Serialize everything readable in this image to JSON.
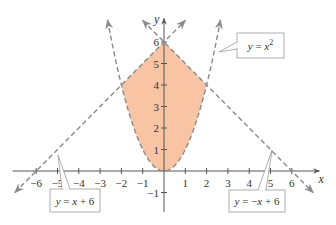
{
  "figure": {
    "type": "region-between-curves",
    "fill_color": "#F9C4A3",
    "curve_color": "#8a8a8a",
    "axis_color": "#555555",
    "x_axis": {
      "label": "x",
      "range": [
        -7,
        7
      ],
      "ticks": [
        -6,
        -5,
        -4,
        -3,
        -2,
        -1,
        1,
        2,
        3,
        4,
        5,
        6
      ],
      "tick_labels": [
        "−6",
        "−5",
        "−4",
        "−3",
        "−2",
        "−1",
        "1",
        "2",
        "3",
        "4",
        "5",
        "6"
      ]
    },
    "y_axis": {
      "label": "y",
      "range": [
        -1.5,
        7
      ],
      "ticks": [
        -1,
        1,
        2,
        3,
        4,
        5,
        6
      ],
      "tick_labels": [
        "−1",
        "1",
        "2",
        "3",
        "4",
        "5",
        "6"
      ]
    },
    "curves": [
      {
        "id": "parabola",
        "equation": "y = x^2",
        "label_parts": [
          "y",
          " = ",
          "x",
          "2"
        ],
        "domain": [
          -2.65,
          2.65
        ],
        "style": "dashed"
      },
      {
        "id": "line-left",
        "equation": "y = x + 6",
        "label_parts": [
          "y",
          " = ",
          "x",
          " + 6"
        ],
        "domain": [
          -7,
          1
        ],
        "style": "dashed"
      },
      {
        "id": "line-right",
        "equation": "y = -x + 6",
        "label_parts": [
          "y",
          " = −",
          "x",
          " + 6"
        ],
        "domain": [
          -1,
          7
        ],
        "style": "dashed"
      }
    ],
    "region": {
      "description": "Shaded region bounded below by y = x^2 and above by y = -|x| + 6",
      "vertices": [
        [
          -2,
          4
        ],
        [
          0,
          6
        ],
        [
          2,
          4
        ]
      ],
      "x_range": [
        -2,
        2
      ]
    },
    "callouts": [
      {
        "curve": "parabola",
        "text": "y = x²"
      },
      {
        "curve": "line-left",
        "text": "y = x + 6"
      },
      {
        "curve": "line-right",
        "text": "y = −x + 6"
      }
    ]
  }
}
